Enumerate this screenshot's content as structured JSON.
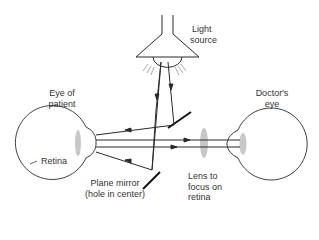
{
  "diagram": {
    "type": "ophthalmoscope-optics",
    "labels": {
      "light_source_1": "Light",
      "light_source_2": "source",
      "patient_eye_1": "Eye of",
      "patient_eye_2": "patient",
      "doctor_eye_1": "Doctor's",
      "doctor_eye_2": "eye",
      "retina": "Retina",
      "mirror_1": "Plane mirror",
      "mirror_2": "(hole in center)",
      "lens_1": "Lens to",
      "lens_2": "focus on",
      "lens_3": "retina"
    },
    "colors": {
      "stroke": "#2a2a2a",
      "lens_fill": "#c8c8c8",
      "text": "#333333"
    }
  }
}
